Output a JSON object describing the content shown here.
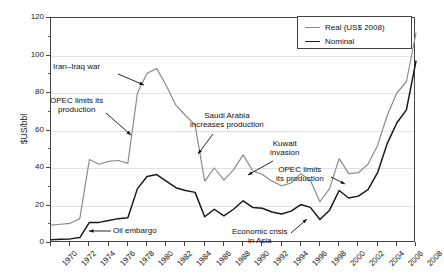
{
  "chart_data": {
    "type": "line",
    "title": "",
    "xlabel": "",
    "ylabel": "$US/bbl",
    "xlim": [
      1970,
      2008
    ],
    "ylim": [
      0,
      120
    ],
    "grid": true,
    "legend_position": "top-right",
    "y_ticks": [
      0,
      20,
      40,
      60,
      80,
      100,
      120
    ],
    "x_ticks": [
      1970,
      1972,
      1974,
      1976,
      1978,
      1980,
      1982,
      1984,
      1986,
      1988,
      1990,
      1992,
      1994,
      1996,
      1998,
      2000,
      2002,
      2004,
      2006,
      2008
    ],
    "x": [
      1970,
      1971,
      1972,
      1973,
      1974,
      1975,
      1976,
      1977,
      1978,
      1979,
      1980,
      1981,
      1982,
      1983,
      1984,
      1985,
      1986,
      1987,
      1988,
      1989,
      1990,
      1991,
      1992,
      1993,
      1994,
      1995,
      1996,
      1997,
      1998,
      1999,
      2000,
      2001,
      2002,
      2003,
      2004,
      2005,
      2006,
      2007,
      2008
    ],
    "series": [
      {
        "name": "Real (US$ 2008)",
        "color": "#8c8c8c",
        "values": [
          9.5,
          10.0,
          10.5,
          13.0,
          44.5,
          42.0,
          43.5,
          44.0,
          42.5,
          80.0,
          90.5,
          93.0,
          84.0,
          73.5,
          68.0,
          63.0,
          33.0,
          40.0,
          33.5,
          39.0,
          47.0,
          38.5,
          36.5,
          33.0,
          30.5,
          32.0,
          37.0,
          33.5,
          22.0,
          29.0,
          45.0,
          37.0,
          37.5,
          42.0,
          52.0,
          68.0,
          80.0,
          86.0,
          112.0
        ]
      },
      {
        "name": "Nominal",
        "color": "#1a1a1a",
        "values": [
          1.8,
          2.0,
          2.2,
          2.9,
          11.0,
          11.0,
          12.0,
          13.0,
          13.5,
          29.0,
          35.5,
          36.5,
          33.0,
          29.5,
          28.0,
          27.0,
          14.0,
          18.0,
          14.5,
          18.0,
          22.5,
          19.0,
          18.5,
          16.5,
          15.5,
          17.0,
          20.5,
          19.0,
          12.5,
          17.5,
          28.0,
          24.0,
          25.0,
          28.5,
          37.5,
          53.0,
          64.0,
          71.0,
          97.0
        ]
      }
    ],
    "annotations": [
      {
        "id": "iran-iraq-war",
        "text": [
          "Iran–Iraq war"
        ],
        "label_x": 53,
        "label_y": 63,
        "arrow": [
          [
            117,
            73
          ],
          [
            143,
            84
          ]
        ]
      },
      {
        "id": "opec-limits-production-1970s",
        "text": [
          "OPEC limits its",
          "production"
        ],
        "label_x": 50,
        "label_y": 97,
        "arrow": [
          [
            105,
            112
          ],
          [
            130,
            134
          ]
        ]
      },
      {
        "id": "oil-embargo",
        "text": [
          "Oil embargo"
        ],
        "label_x": 113,
        "label_y": 227,
        "arrow": [
          [
            110,
            230
          ],
          [
            88,
            230
          ]
        ]
      },
      {
        "id": "saudi-arabia-increases-production",
        "text": [
          "Saudi Arabia",
          "increases production"
        ],
        "label_x": 190,
        "label_y": 112,
        "arrow": [
          [
            212,
            133
          ],
          [
            197,
            153
          ]
        ]
      },
      {
        "id": "kuwait-invasion",
        "text": [
          "Kuwait",
          "invasion"
        ],
        "label_x": 270,
        "label_y": 140,
        "arrow": [
          [
            272,
            160
          ],
          [
            247,
            174
          ]
        ]
      },
      {
        "id": "opec-limits-production-1990s",
        "text": [
          "OPEC limits",
          "its production"
        ],
        "label_x": 276,
        "label_y": 166,
        "arrow": [
          [
            330,
            176
          ],
          [
            344,
            183
          ]
        ]
      },
      {
        "id": "economic-crisis-in-asia",
        "text": [
          "Economic crisis",
          "in Asia"
        ],
        "label_x": 232,
        "label_y": 228,
        "arrow": [
          [
            290,
            232
          ],
          [
            306,
            218
          ]
        ]
      }
    ]
  },
  "legend": {
    "entries": [
      {
        "label": "Real (US$ 2008)",
        "color": "#8c8c8c"
      },
      {
        "label": "Nominal",
        "color": "#1a1a1a"
      }
    ]
  }
}
